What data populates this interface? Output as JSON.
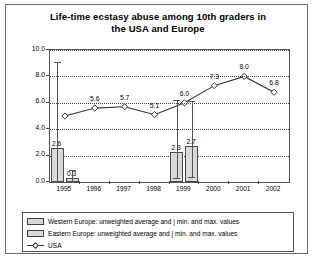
{
  "chart_data": {
    "type": "bar",
    "title": "Life-time ecstasy abuse among 10th graders in the USA and Europe",
    "title_line1": "Life-time ecstasy abuse among 10th graders in",
    "title_line2": "the USA and Europe",
    "xlabel": "",
    "ylabel": "",
    "ylim": [
      0.0,
      10.0
    ],
    "grid": true,
    "legend_position": "bottom",
    "categories": [
      "1995",
      "1996",
      "1997",
      "1998",
      "1999",
      "2000",
      "2001",
      "2002"
    ],
    "ytick_labels": [
      "0.0",
      "2.0",
      "4.0",
      "6.0",
      "8.0",
      "10.0"
    ],
    "ytick_values": [
      0.0,
      2.0,
      4.0,
      6.0,
      8.0,
      10.0
    ],
    "series": [
      {
        "name": "Western Europe: unweighted average and  | min. and max. values",
        "short_name": "Western Europe",
        "type": "bar",
        "values": [
          2.6,
          null,
          null,
          null,
          2.3,
          null,
          null,
          null
        ],
        "labels": [
          "2.6",
          "",
          "",
          "",
          "2.3",
          "",
          "",
          ""
        ],
        "errors_min": [
          0.1,
          null,
          null,
          null,
          0.3,
          null,
          null,
          null
        ],
        "errors_max": [
          9.1,
          null,
          null,
          null,
          6.2,
          null,
          null,
          null
        ]
      },
      {
        "name": "Eastern Europe: unweighted average and  | min. and max. values",
        "short_name": "Eastern Europe",
        "type": "bar",
        "values": [
          0.3,
          null,
          null,
          null,
          2.7,
          null,
          null,
          null
        ],
        "labels": [
          "0.3",
          "",
          "",
          "",
          "2.7",
          "",
          "",
          ""
        ],
        "errors_min": [
          0.1,
          null,
          null,
          null,
          0.4,
          null,
          null,
          null
        ],
        "errors_max": [
          0.9,
          null,
          null,
          null,
          6.1,
          null,
          null,
          null
        ]
      },
      {
        "name": "USA",
        "short_name": "USA",
        "type": "line",
        "values": [
          5.0,
          5.6,
          5.7,
          5.1,
          6.0,
          7.3,
          8.0,
          6.8
        ],
        "labels": [
          "",
          "5.6",
          "5.7",
          "5.1",
          "6.0",
          "7.3",
          "8.0",
          "6.8"
        ]
      }
    ]
  },
  "legend": {
    "items": [
      {
        "label": "Western Europe: unweighted average and  | min. and max. values",
        "marker": "bar-swatch"
      },
      {
        "label": "Eastern Europe: unweighted average and  | min. and max. values",
        "marker": "bar-swatch"
      },
      {
        "label": "USA",
        "marker": "line-diamond-marker"
      }
    ]
  },
  "colors": {
    "bar_fill": "#d9d9d9",
    "bar_border": "#4a4a4a",
    "line": "#333333",
    "grid": "#4a4a4a",
    "text": "#000000"
  }
}
